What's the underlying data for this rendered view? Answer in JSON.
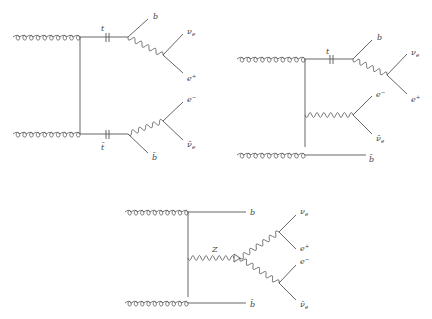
{
  "diagrams": [
    {
      "id": "ttbar-pair",
      "description": "gg -> t tbar, t -> b W+ (nu_e e+), tbar -> bbar W- (e- nubar_e)",
      "labels": {
        "top": "t",
        "antitop": "t̄",
        "b_top": "b",
        "nu_top": "ν",
        "nu_top_sub": "e",
        "e_plus": "e",
        "e_plus_sup": "+",
        "e_minus": "e",
        "e_minus_sup": "−",
        "nubar": "ν̄",
        "nubar_sub": "e",
        "bbar": "b̄"
      }
    },
    {
      "id": "single-top-tW",
      "description": "gg -> t W- bbar",
      "labels": {
        "top": "t",
        "b_top": "b",
        "nu_top": "ν",
        "nu_top_sub": "e",
        "e_plus": "e",
        "e_plus_sup": "+",
        "e_minus": "e",
        "e_minus_sup": "−",
        "nubar": "ν̄",
        "nubar_sub": "e",
        "bbar": "b̄"
      }
    },
    {
      "id": "bbZ",
      "description": "gg -> b bbar Z, Z -> W+ W-",
      "labels": {
        "z": "Z",
        "b": "b",
        "bbar": "b̄",
        "nu": "ν",
        "nu_sub": "e",
        "e_plus": "e",
        "e_plus_sup": "+",
        "e_minus": "e",
        "e_minus_sup": "−",
        "nubar": "ν̄",
        "nubar_sub": "e"
      }
    }
  ]
}
